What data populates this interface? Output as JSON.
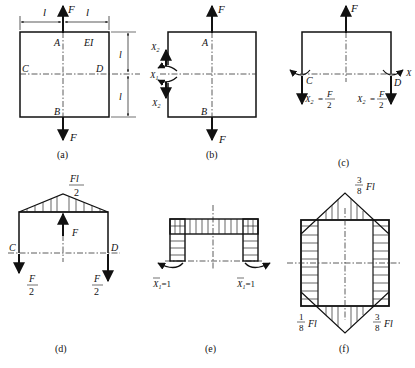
{
  "panels": {
    "a": {
      "caption": "(a)",
      "labels": {
        "dim_left": "l",
        "dim_right": "l",
        "dim_top_vertical": "l",
        "dim_bottom_vertical": "l",
        "force_top": "F",
        "force_bottom": "F",
        "point_A": "A",
        "point_B": "B",
        "point_C": "C",
        "point_D": "D",
        "stiffness": "EI"
      }
    },
    "b": {
      "caption": "(b)",
      "labels": {
        "force_top": "F",
        "force_bottom": "F",
        "point_A": "A",
        "point_B": "B",
        "x1": "X",
        "x1_sub": "1",
        "x2_top": "X",
        "x2_top_sub": "2",
        "x2_bottom": "X",
        "x2_bottom_sub": "2"
      }
    },
    "c": {
      "caption": "(c)",
      "labels": {
        "force_top": "F",
        "point_C": "C",
        "point_D": "D",
        "x1_right": "X",
        "x2_left": "X",
        "x2_left_sub": "2",
        "x2_left_eq": "=",
        "x2_left_num": "F",
        "x2_left_den": "2",
        "x2_right": "X",
        "x2_right_sub": "2",
        "x2_right_eq": "=",
        "x2_right_num": "F",
        "x2_right_den": "2"
      }
    },
    "d": {
      "caption": "(d)",
      "labels": {
        "peak_num": "Fl",
        "peak_den": "2",
        "force_mid": "F",
        "point_C": "C",
        "point_D": "D",
        "left_num": "F",
        "left_den": "2",
        "right_num": "F",
        "right_den": "2"
      }
    },
    "e": {
      "caption": "(e)",
      "labels": {
        "left_moment": "X",
        "left_moment_sub": "1",
        "left_moment_val": "=1",
        "right_moment": "X",
        "right_moment_sub": "1",
        "right_moment_val": "=1"
      }
    },
    "f": {
      "caption": "(f)",
      "labels": {
        "top_num": "3",
        "top_den": "8",
        "top_unit": "Fl",
        "bl_num": "1",
        "bl_den": "8",
        "bl_unit": "Fl",
        "br_num": "3",
        "br_den": "8",
        "br_unit": "Fl"
      }
    }
  },
  "colors": {
    "ink": "#111111",
    "background": "#ffffff"
  }
}
